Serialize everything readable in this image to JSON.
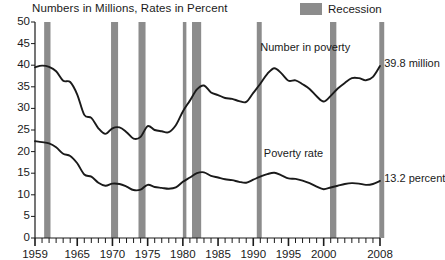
{
  "chart_data": {
    "type": "line",
    "title": "Numbers in Millions, Rates in Percent",
    "xlabel": "",
    "ylabel": "",
    "xlim": [
      1959,
      2008
    ],
    "ylim": [
      0,
      50
    ],
    "ytick_step": 5,
    "grid": false,
    "legend_position": "top-right",
    "x_ticks_major": [
      "1959",
      "1965",
      "1970",
      "1975",
      "1980",
      "1985",
      "1990",
      "1995",
      "2000",
      "2008"
    ],
    "x_ticks_major_values": [
      1959,
      1965,
      1970,
      1975,
      1980,
      1985,
      1990,
      1995,
      2000,
      2008
    ],
    "y_ticks": [
      "0",
      "5",
      "10",
      "15",
      "20",
      "25",
      "30",
      "35",
      "40",
      "45",
      "50"
    ],
    "y_tick_values": [
      0,
      5,
      10,
      15,
      20,
      25,
      30,
      35,
      40,
      45,
      50
    ],
    "x_minor_ticks_interval": 1,
    "legend": [
      {
        "label": "Recession",
        "color": "#8c8c8c",
        "type": "band"
      }
    ],
    "annotations": [
      {
        "text": "Number in poverty",
        "x": 1991.0,
        "y": 44.0
      },
      {
        "text": "39.8 million",
        "x": 2008.6,
        "y": 40.3
      },
      {
        "text": "Poverty rate",
        "x": 1991.5,
        "y": 19.5
      },
      {
        "text": "13.2 percent",
        "x": 2008.6,
        "y": 13.6
      }
    ],
    "recession_bands": [
      {
        "start": 1960.3,
        "end": 1961.2
      },
      {
        "start": 1969.8,
        "end": 1970.8
      },
      {
        "start": 1973.7,
        "end": 1974.7
      },
      {
        "start": 1980.0,
        "end": 1980.5
      },
      {
        "start": 1981.3,
        "end": 1982.6
      },
      {
        "start": 1990.5,
        "end": 1991.2
      },
      {
        "start": 2000.9,
        "end": 2001.8
      },
      {
        "start": 2007.9,
        "end": 2008.6
      }
    ],
    "series": [
      {
        "name": "Number in poverty",
        "units": "millions",
        "color": "#1a1a1a",
        "end_label": "39.8 million",
        "x": [
          1959,
          1960,
          1961,
          1962,
          1963,
          1964,
          1965,
          1966,
          1967,
          1968,
          1969,
          1970,
          1971,
          1972,
          1973,
          1974,
          1975,
          1976,
          1977,
          1978,
          1979,
          1980,
          1981,
          1982,
          1983,
          1984,
          1985,
          1986,
          1987,
          1988,
          1989,
          1990,
          1991,
          1992,
          1993,
          1994,
          1995,
          1996,
          1997,
          1998,
          1999,
          2000,
          2001,
          2002,
          2003,
          2004,
          2005,
          2006,
          2007,
          2008
        ],
        "values": [
          39.5,
          39.9,
          39.6,
          38.6,
          36.4,
          36.1,
          33.2,
          28.5,
          27.8,
          25.4,
          24.1,
          25.4,
          25.6,
          24.5,
          23.0,
          23.4,
          25.9,
          25.0,
          24.7,
          24.5,
          26.1,
          29.3,
          31.8,
          34.4,
          35.3,
          33.7,
          33.1,
          32.4,
          32.2,
          31.7,
          31.5,
          33.6,
          35.7,
          38.0,
          39.3,
          38.1,
          36.4,
          36.5,
          35.6,
          34.5,
          32.8,
          31.6,
          32.9,
          34.6,
          35.9,
          37.0,
          37.0,
          36.5,
          37.3,
          39.8
        ]
      },
      {
        "name": "Poverty rate",
        "units": "percent",
        "color": "#1a1a1a",
        "end_label": "13.2 percent",
        "x": [
          1959,
          1960,
          1961,
          1962,
          1963,
          1964,
          1965,
          1966,
          1967,
          1968,
          1969,
          1970,
          1971,
          1972,
          1973,
          1974,
          1975,
          1976,
          1977,
          1978,
          1979,
          1980,
          1981,
          1982,
          1983,
          1984,
          1985,
          1986,
          1987,
          1988,
          1989,
          1990,
          1991,
          1992,
          1993,
          1994,
          1995,
          1996,
          1997,
          1998,
          1999,
          2000,
          2001,
          2002,
          2003,
          2004,
          2005,
          2006,
          2007,
          2008
        ],
        "values": [
          22.4,
          22.2,
          21.9,
          21.0,
          19.5,
          19.0,
          17.3,
          14.7,
          14.2,
          12.8,
          12.1,
          12.6,
          12.5,
          11.9,
          11.1,
          11.2,
          12.3,
          11.8,
          11.6,
          11.4,
          11.7,
          13.0,
          14.0,
          15.0,
          15.2,
          14.4,
          14.0,
          13.6,
          13.4,
          13.0,
          12.8,
          13.5,
          14.2,
          14.8,
          15.1,
          14.5,
          13.8,
          13.7,
          13.3,
          12.7,
          11.9,
          11.3,
          11.7,
          12.1,
          12.5,
          12.7,
          12.6,
          12.3,
          12.5,
          13.2
        ]
      }
    ]
  },
  "plot": {
    "left": 35,
    "right": 380,
    "top": 22,
    "bottom": 238,
    "band_color": "#8c8c8c",
    "axis_color": "#1a1a1a",
    "background": "#ffffff"
  }
}
